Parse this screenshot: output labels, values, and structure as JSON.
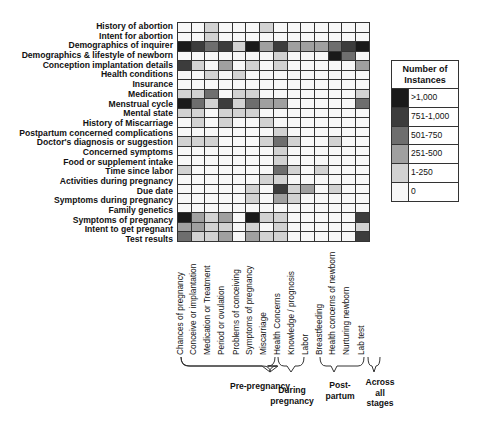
{
  "chart_data": {
    "type": "heatmap",
    "title": "",
    "legend_title": "Number of Instances",
    "legend": [
      {
        "label": ">1,000",
        "level": 5,
        "color": "#1a1a1a"
      },
      {
        "label": "751-1,000",
        "level": 4,
        "color": "#3c3c3c"
      },
      {
        "label": "501-750",
        "level": 3,
        "color": "#6e6e6e"
      },
      {
        "label": "251-500",
        "level": 2,
        "color": "#a0a0a0"
      },
      {
        "label": "1-250",
        "level": 1,
        "color": "#d2d2d2"
      },
      {
        "label": "0",
        "level": 0,
        "color": "#f7f7f7"
      }
    ],
    "rows": [
      "History of abortion",
      "Intent for abortion",
      "Demographics of inquirer",
      "Demographics & lifestyle of newborn",
      "Conception implantation details",
      "Health conditions",
      "Insurance",
      "Medication",
      "Menstrual cycle",
      "Mental state",
      "History of Miscarriage",
      "Postpartum concerned complications",
      "Doctor's diagnosis or suggestion",
      "Concerned symptoms",
      "Food or supplement intake",
      "Time since labor",
      "Activities during pregnancy",
      "Due date",
      "Symptoms during pregnancy",
      "Family genetics",
      "Symptoms of pregnancy",
      "Intent to get pregnant",
      "Test results"
    ],
    "columns": [
      "Chances of pregnancy",
      "Conceive or implantation",
      "Medication or Treatment",
      "Period or ovulation",
      "Problems of conceiving",
      "Symptoms of pregnancy",
      "Miscarriage",
      "Health Concerns",
      "Knowledge / prognosis",
      "Labor",
      "Breastfeeding",
      "Health concerns of newborn",
      "Nurturing newborn",
      "Lab test"
    ],
    "values": [
      [
        0,
        0,
        1,
        0,
        0,
        0,
        1,
        0,
        0,
        0,
        0,
        0,
        0,
        0
      ],
      [
        0,
        0,
        1,
        0,
        0,
        0,
        0,
        0,
        0,
        0,
        0,
        0,
        0,
        0
      ],
      [
        5,
        4,
        3,
        4,
        1,
        5,
        2,
        4,
        2,
        2,
        2,
        3,
        4,
        5
      ],
      [
        0,
        0,
        0,
        0,
        0,
        0,
        0,
        1,
        0,
        0,
        0,
        5,
        3,
        0
      ],
      [
        4,
        1,
        0,
        2,
        0,
        1,
        0,
        1,
        0,
        0,
        0,
        0,
        0,
        2
      ],
      [
        0,
        0,
        1,
        0,
        1,
        0,
        0,
        0,
        0,
        0,
        0,
        0,
        0,
        0
      ],
      [
        0,
        0,
        0,
        0,
        0,
        0,
        0,
        0,
        0,
        0,
        0,
        0,
        0,
        0
      ],
      [
        1,
        1,
        3,
        0,
        1,
        1,
        0,
        0,
        0,
        0,
        0,
        0,
        0,
        1
      ],
      [
        5,
        3,
        1,
        4,
        1,
        3,
        2,
        2,
        0,
        0,
        0,
        0,
        0,
        3
      ],
      [
        1,
        1,
        0,
        1,
        1,
        1,
        0,
        0,
        0,
        0,
        0,
        0,
        0,
        0
      ],
      [
        0,
        1,
        0,
        1,
        0,
        0,
        1,
        0,
        0,
        0,
        0,
        0,
        0,
        0
      ],
      [
        0,
        0,
        0,
        0,
        0,
        0,
        0,
        1,
        0,
        0,
        0,
        0,
        0,
        0
      ],
      [
        1,
        1,
        1,
        0,
        0,
        0,
        1,
        3,
        1,
        0,
        0,
        1,
        0,
        0
      ],
      [
        0,
        0,
        0,
        0,
        0,
        0,
        0,
        1,
        0,
        0,
        0,
        0,
        0,
        0
      ],
      [
        0,
        0,
        0,
        0,
        0,
        0,
        0,
        1,
        0,
        0,
        0,
        0,
        0,
        0
      ],
      [
        1,
        0,
        0,
        0,
        0,
        0,
        0,
        3,
        1,
        0,
        1,
        0,
        0,
        0
      ],
      [
        0,
        0,
        0,
        0,
        0,
        0,
        1,
        1,
        0,
        0,
        0,
        0,
        0,
        0
      ],
      [
        0,
        0,
        0,
        0,
        0,
        1,
        0,
        4,
        1,
        2,
        0,
        1,
        0,
        0
      ],
      [
        0,
        0,
        0,
        0,
        0,
        1,
        0,
        2,
        1,
        0,
        0,
        0,
        0,
        0
      ],
      [
        0,
        0,
        0,
        0,
        0,
        0,
        0,
        0,
        0,
        0,
        0,
        0,
        0,
        0
      ],
      [
        5,
        2,
        1,
        2,
        0,
        5,
        1,
        1,
        0,
        0,
        0,
        0,
        0,
        4
      ],
      [
        2,
        2,
        1,
        1,
        0,
        1,
        0,
        1,
        0,
        0,
        0,
        0,
        0,
        1
      ],
      [
        3,
        1,
        1,
        2,
        0,
        2,
        1,
        1,
        0,
        0,
        0,
        0,
        0,
        4
      ]
    ],
    "groups": [
      {
        "label": "Pre-pregnancy",
        "columns": [
          0,
          6
        ]
      },
      {
        "label": "During pregnancy",
        "columns": [
          7,
          8
        ]
      },
      {
        "label": "Post-partum",
        "columns": [
          9,
          12
        ]
      },
      {
        "label": "Across all stages",
        "columns": [
          13,
          13
        ]
      }
    ]
  },
  "groups_text": {
    "pre": "Pre-pregnancy",
    "during_1": "During",
    "during_2": "pregnancy",
    "post_1": "Post-",
    "post_2": "partum",
    "across_1": "Across",
    "across_2": "all",
    "across_3": "stages"
  }
}
